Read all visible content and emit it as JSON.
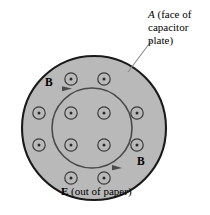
{
  "figure": {
    "name": "capacitor-plate-face-diagram",
    "background_color": "#ffffff",
    "width": 210,
    "height": 215
  },
  "labels": {
    "plate_line1_italic": "A",
    "plate_line1_rest": " (face of",
    "plate_line2": "capacitor",
    "plate_line3": "plate)",
    "plate_full": "A (face of capacitor plate)",
    "b_field_top": "B",
    "b_field_bottom": "B",
    "e_field_symbol": "E",
    "e_field_rest": " (out of paper)",
    "e_field_full": "E (out of paper)"
  },
  "colors": {
    "disk_fill": "#b9b9b9",
    "disk_stroke": "#1a1a1a",
    "marker_stroke": "#3a3a3a",
    "marker_fill": "#b9b9b9",
    "dot_fill": "#2a2a2a",
    "b_circle_stroke": "#4a4a4a",
    "leader_line": "#8a8a8a",
    "text": "#000000"
  },
  "geometry": {
    "capacitor_disk": {
      "shape": "circle",
      "center_x": 94,
      "center_y": 128,
      "radius": 72,
      "stroke_width": 2.1
    },
    "b_field_circle": {
      "shape": "circle",
      "center_x": 92,
      "center_y": 128,
      "radius": 40,
      "stroke_width": 1.6,
      "direction": "clockwise",
      "arrowhead_count": 2
    },
    "leader_line": {
      "x1": 128,
      "y1": 72,
      "x2": 152,
      "y2": 40
    }
  },
  "field_markers": {
    "symbol": "circle-with-center-dot",
    "meaning": "electric field E directed out of the page",
    "count": 12,
    "outer_radius": 6.2,
    "dot_radius": 1.5,
    "positions": [
      {
        "x": 71,
        "y": 79,
        "id": "marker-top-left"
      },
      {
        "x": 104,
        "y": 79,
        "id": "marker-top-right"
      },
      {
        "x": 39,
        "y": 113,
        "id": "marker-left-upper"
      },
      {
        "x": 71,
        "y": 113,
        "id": "marker-mid-upper-left"
      },
      {
        "x": 104,
        "y": 113,
        "id": "marker-mid-upper-right"
      },
      {
        "x": 137,
        "y": 113,
        "id": "marker-right-upper"
      },
      {
        "x": 39,
        "y": 145,
        "id": "marker-left-lower"
      },
      {
        "x": 71,
        "y": 145,
        "id": "marker-mid-lower-left"
      },
      {
        "x": 104,
        "y": 145,
        "id": "marker-mid-lower-right"
      },
      {
        "x": 137,
        "y": 145,
        "id": "marker-right-lower"
      },
      {
        "x": 71,
        "y": 178,
        "id": "marker-bottom-left"
      },
      {
        "x": 104,
        "y": 178,
        "id": "marker-bottom-right"
      }
    ]
  }
}
